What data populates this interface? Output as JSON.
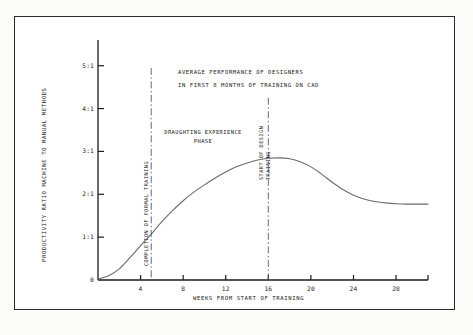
{
  "chart_data": {
    "type": "line",
    "title": "AVERAGE PERFORMANCE OF DESIGNERS",
    "subtitle": "IN FIRST 8 MONTHS OF TRAINING ON CAD",
    "xlabel": "WEEKS FROM START OF TRAINING",
    "ylabel": "PRODUCTIVITY RATIO MACHINE TO MANUAL METHODS",
    "xlim": [
      0,
      31
    ],
    "ylim": [
      0,
      5.6
    ],
    "grid": false,
    "legend": "none",
    "x_ticks": [
      4,
      8,
      12,
      16,
      20,
      24,
      28
    ],
    "x_tick_labels": [
      "4",
      "8",
      "12",
      "16",
      "20",
      "24",
      "28"
    ],
    "y_ticks": [
      0,
      1,
      2,
      3,
      4,
      5
    ],
    "y_tick_labels": [
      "0",
      "1:1",
      "2:1",
      "3:1",
      "4:1",
      "5:1"
    ],
    "series": [
      {
        "name": "Productivity ratio",
        "x": [
          0,
          1,
          2,
          3,
          4,
          5,
          6,
          7,
          8,
          9,
          10,
          11,
          12,
          13,
          14,
          15,
          16,
          17,
          18,
          19,
          20,
          21,
          22,
          23,
          24,
          25,
          26,
          27,
          28,
          29,
          30,
          31
        ],
        "values": [
          0.02,
          0.1,
          0.26,
          0.52,
          0.8,
          1.07,
          1.36,
          1.62,
          1.85,
          2.05,
          2.22,
          2.38,
          2.52,
          2.64,
          2.73,
          2.8,
          2.84,
          2.85,
          2.83,
          2.76,
          2.64,
          2.47,
          2.28,
          2.11,
          1.98,
          1.89,
          1.83,
          1.8,
          1.78,
          1.77,
          1.77,
          1.77
        ]
      }
    ],
    "annotations": [
      {
        "id": "completion-of-formal-training",
        "label": "COMPLETION OF FORMAL TRAINING",
        "x": 5,
        "style": "dash-dot-vertical"
      },
      {
        "id": "start-of-design-training",
        "label_line1": "START OF DESIGN",
        "label_line2": "TRAINING",
        "x": 16,
        "style": "dash-dot-vertical"
      },
      {
        "id": "draughting-experience-phase",
        "label_line1": "DRAUGHTING EXPERIENCE",
        "label_line2": "PHASE",
        "x": 9.5,
        "y": 3.6
      }
    ],
    "colors": {
      "curve": "#6b6b6b",
      "axis": "#1a1a1a",
      "annotation_line": "#4a5a7a",
      "frame": "#2b2b2b",
      "background": "#ffffff"
    }
  }
}
